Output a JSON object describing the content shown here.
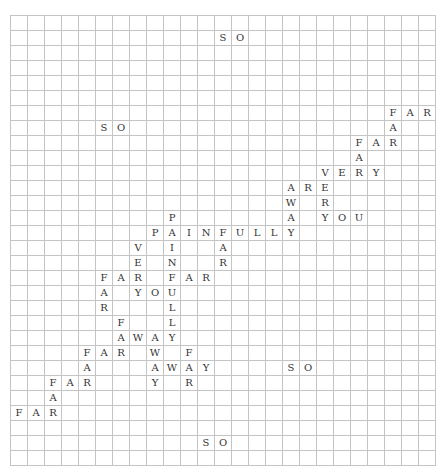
{
  "puzzle": {
    "cols": 25,
    "rows": 30,
    "cells": [
      {
        "r": 1,
        "c": 12,
        "ch": "S"
      },
      {
        "r": 1,
        "c": 13,
        "ch": "O"
      },
      {
        "r": 6,
        "c": 22,
        "ch": "F"
      },
      {
        "r": 6,
        "c": 23,
        "ch": "A"
      },
      {
        "r": 6,
        "c": 24,
        "ch": "R"
      },
      {
        "r": 7,
        "c": 5,
        "ch": "S"
      },
      {
        "r": 7,
        "c": 6,
        "ch": "O"
      },
      {
        "r": 7,
        "c": 22,
        "ch": "A"
      },
      {
        "r": 8,
        "c": 20,
        "ch": "F"
      },
      {
        "r": 8,
        "c": 21,
        "ch": "A"
      },
      {
        "r": 8,
        "c": 22,
        "ch": "R"
      },
      {
        "r": 9,
        "c": 20,
        "ch": "A"
      },
      {
        "r": 10,
        "c": 18,
        "ch": "V"
      },
      {
        "r": 10,
        "c": 19,
        "ch": "E"
      },
      {
        "r": 10,
        "c": 20,
        "ch": "R"
      },
      {
        "r": 10,
        "c": 21,
        "ch": "Y"
      },
      {
        "r": 11,
        "c": 16,
        "ch": "A"
      },
      {
        "r": 11,
        "c": 17,
        "ch": "R"
      },
      {
        "r": 11,
        "c": 18,
        "ch": "E"
      },
      {
        "r": 12,
        "c": 16,
        "ch": "W"
      },
      {
        "r": 12,
        "c": 18,
        "ch": "R"
      },
      {
        "r": 13,
        "c": 9,
        "ch": "P"
      },
      {
        "r": 13,
        "c": 16,
        "ch": "A"
      },
      {
        "r": 13,
        "c": 18,
        "ch": "Y"
      },
      {
        "r": 13,
        "c": 19,
        "ch": "O"
      },
      {
        "r": 13,
        "c": 20,
        "ch": "U"
      },
      {
        "r": 14,
        "c": 8,
        "ch": "P"
      },
      {
        "r": 14,
        "c": 9,
        "ch": "A"
      },
      {
        "r": 14,
        "c": 10,
        "ch": "I"
      },
      {
        "r": 14,
        "c": 11,
        "ch": "N"
      },
      {
        "r": 14,
        "c": 12,
        "ch": "F"
      },
      {
        "r": 14,
        "c": 13,
        "ch": "U"
      },
      {
        "r": 14,
        "c": 14,
        "ch": "L"
      },
      {
        "r": 14,
        "c": 15,
        "ch": "L"
      },
      {
        "r": 14,
        "c": 16,
        "ch": "Y"
      },
      {
        "r": 15,
        "c": 7,
        "ch": "V"
      },
      {
        "r": 15,
        "c": 9,
        "ch": "I"
      },
      {
        "r": 15,
        "c": 12,
        "ch": "A"
      },
      {
        "r": 16,
        "c": 7,
        "ch": "E"
      },
      {
        "r": 16,
        "c": 9,
        "ch": "N"
      },
      {
        "r": 16,
        "c": 12,
        "ch": "R"
      },
      {
        "r": 17,
        "c": 5,
        "ch": "F"
      },
      {
        "r": 17,
        "c": 6,
        "ch": "A"
      },
      {
        "r": 17,
        "c": 7,
        "ch": "R"
      },
      {
        "r": 17,
        "c": 9,
        "ch": "F"
      },
      {
        "r": 17,
        "c": 10,
        "ch": "A"
      },
      {
        "r": 17,
        "c": 11,
        "ch": "R"
      },
      {
        "r": 18,
        "c": 5,
        "ch": "A"
      },
      {
        "r": 18,
        "c": 7,
        "ch": "Y"
      },
      {
        "r": 18,
        "c": 8,
        "ch": "O"
      },
      {
        "r": 18,
        "c": 9,
        "ch": "U"
      },
      {
        "r": 19,
        "c": 5,
        "ch": "R"
      },
      {
        "r": 19,
        "c": 9,
        "ch": "L"
      },
      {
        "r": 20,
        "c": 6,
        "ch": "F"
      },
      {
        "r": 20,
        "c": 9,
        "ch": "L"
      },
      {
        "r": 21,
        "c": 6,
        "ch": "A"
      },
      {
        "r": 21,
        "c": 7,
        "ch": "W"
      },
      {
        "r": 21,
        "c": 8,
        "ch": "A"
      },
      {
        "r": 21,
        "c": 9,
        "ch": "Y"
      },
      {
        "r": 22,
        "c": 4,
        "ch": "F"
      },
      {
        "r": 22,
        "c": 5,
        "ch": "A"
      },
      {
        "r": 22,
        "c": 6,
        "ch": "R"
      },
      {
        "r": 22,
        "c": 8,
        "ch": "W"
      },
      {
        "r": 22,
        "c": 10,
        "ch": "F"
      },
      {
        "r": 23,
        "c": 4,
        "ch": "A"
      },
      {
        "r": 23,
        "c": 8,
        "ch": "A"
      },
      {
        "r": 23,
        "c": 9,
        "ch": "W"
      },
      {
        "r": 23,
        "c": 10,
        "ch": "A"
      },
      {
        "r": 23,
        "c": 11,
        "ch": "Y"
      },
      {
        "r": 23,
        "c": 16,
        "ch": "S"
      },
      {
        "r": 23,
        "c": 17,
        "ch": "O"
      },
      {
        "r": 24,
        "c": 2,
        "ch": "F"
      },
      {
        "r": 24,
        "c": 3,
        "ch": "A"
      },
      {
        "r": 24,
        "c": 4,
        "ch": "R"
      },
      {
        "r": 24,
        "c": 8,
        "ch": "Y"
      },
      {
        "r": 24,
        "c": 10,
        "ch": "R"
      },
      {
        "r": 25,
        "c": 2,
        "ch": "A"
      },
      {
        "r": 26,
        "c": 0,
        "ch": "F"
      },
      {
        "r": 26,
        "c": 1,
        "ch": "A"
      },
      {
        "r": 26,
        "c": 2,
        "ch": "R"
      },
      {
        "r": 28,
        "c": 11,
        "ch": "S"
      },
      {
        "r": 28,
        "c": 12,
        "ch": "O"
      }
    ],
    "words": [
      "SO",
      "FAR",
      "FAR",
      "SO",
      "FAR",
      "VERY",
      "ARE",
      "AWAY",
      "YOU",
      "PAIN",
      "PAINFULLY",
      "FAR",
      "VERY",
      "FAR",
      "FAR",
      "YOU",
      "PAINFULLY",
      "FAR",
      "FAR",
      "AWAY",
      "FAR",
      "AWAY",
      "FAR",
      "AWAY",
      "FAR",
      "FAR",
      "FAR",
      "SO",
      "SO"
    ]
  }
}
